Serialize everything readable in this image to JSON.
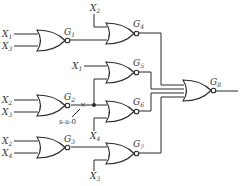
{
  "diagram": {
    "type": "logic-circuit",
    "gates": [
      {
        "id": "G1",
        "name": "G",
        "sub": "1",
        "kind": "NOR",
        "inputs": [
          "X1",
          "X3"
        ]
      },
      {
        "id": "G2",
        "name": "G",
        "sub": "2",
        "kind": "NOR",
        "inputs": [
          "X2",
          "X3"
        ]
      },
      {
        "id": "G3",
        "name": "G",
        "sub": "3",
        "kind": "NOR",
        "inputs": [
          "X2",
          "X4"
        ]
      },
      {
        "id": "G4",
        "name": "G",
        "sub": "4",
        "kind": "NOR",
        "inputs": [
          "X2",
          "G1"
        ]
      },
      {
        "id": "G5",
        "name": "G",
        "sub": "5",
        "kind": "NOR",
        "inputs": [
          "X1",
          "G2"
        ]
      },
      {
        "id": "G6",
        "name": "G",
        "sub": "6",
        "kind": "NOR",
        "inputs": [
          "G2",
          "X4"
        ]
      },
      {
        "id": "G7",
        "name": "G",
        "sub": "7",
        "kind": "NOR",
        "inputs": [
          "G3",
          "X3"
        ]
      },
      {
        "id": "G8",
        "name": "G",
        "sub": "8",
        "kind": "NOR",
        "inputs": [
          "G4",
          "G5",
          "G6",
          "G7"
        ]
      }
    ],
    "input_labels": {
      "g1_a": {
        "name": "X",
        "sub": "1"
      },
      "g1_b": {
        "name": "X",
        "sub": "3"
      },
      "g2_a": {
        "name": "X",
        "sub": "2"
      },
      "g2_b": {
        "name": "X",
        "sub": "3"
      },
      "g3_a": {
        "name": "X",
        "sub": "2"
      },
      "g3_b": {
        "name": "X",
        "sub": "4"
      },
      "g4_a": {
        "name": "X",
        "sub": "2"
      },
      "g5_a": {
        "name": "X",
        "sub": "1"
      },
      "g6_b": {
        "name": "X",
        "sub": "4"
      },
      "g7_b": {
        "name": "X",
        "sub": "3"
      }
    },
    "fault": {
      "location": "G2 output",
      "label": "s-a-0"
    }
  }
}
